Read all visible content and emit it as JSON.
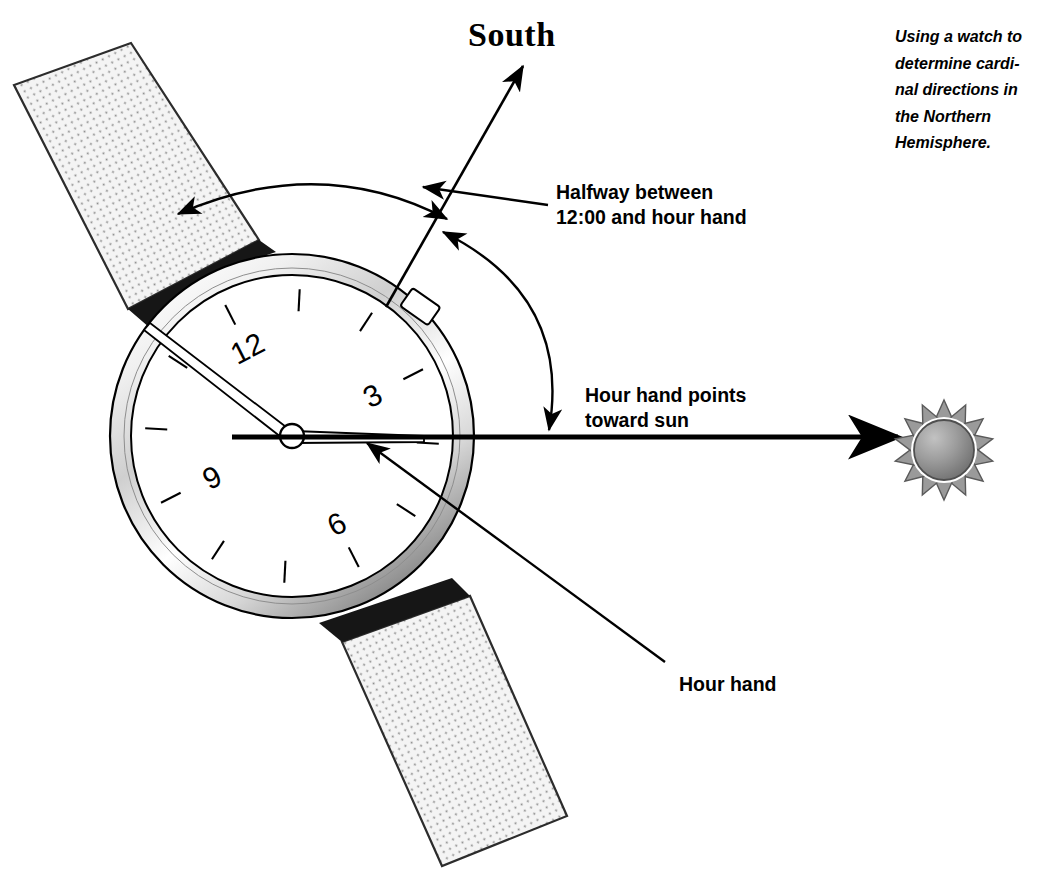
{
  "figure": {
    "caption": "Using a watch to determine cardi-\nnal directions in the Northern\nHemisphere.",
    "background_color": "#ffffff",
    "ink_color": "#000000"
  },
  "labels": {
    "south": "South",
    "halfway": "Halfway between\n12:00 and hour hand",
    "hour_points_toward_sun": "Hour hand points\ntoward sun",
    "hour_hand": "Hour hand"
  },
  "watch": {
    "rotation_degrees": -27,
    "center": {
      "x": 292,
      "y": 436
    },
    "dial_radius": 160,
    "case_outer_radius": 182,
    "case_inner_radius": 163,
    "numerals": [
      {
        "label": "12",
        "hour": 12
      },
      {
        "label": "3",
        "hour": 3
      },
      {
        "label": "6",
        "hour": 6
      },
      {
        "label": "9",
        "hour": 9
      }
    ],
    "tick_count": 12,
    "hands": {
      "hour": {
        "points_to_hours": 3.0,
        "label": "hour-hand"
      },
      "minute": {
        "points_to_minutes": 52,
        "label": "minute-hand"
      }
    },
    "crown": {
      "at_hour": 2.2
    },
    "band": {
      "fill_color": "#f2f2f2",
      "dot_color": "#808080",
      "shadow_color": "#1a1a1a"
    },
    "case_colors": {
      "highlight": "#ffffff",
      "midtone": "#c9c9c9",
      "shadow": "#6e6e6e",
      "outline": "#000000"
    },
    "dial_color": "#ffffff"
  },
  "sun": {
    "center": {
      "x": 944,
      "y": 450
    },
    "disc_radius": 31,
    "ray_count": 14,
    "disc_color_light": "#b4b4b4",
    "disc_color_dark": "#6d6d6d",
    "ray_color": "#9a9a9a",
    "outline_color": "#4a4a4a"
  },
  "arrows": {
    "south_arrow": {
      "from": {
        "x": 390,
        "y": 300
      },
      "to": {
        "x": 524,
        "y": 65
      },
      "name": "south-direction-arrow"
    },
    "sun_arrow": {
      "from": {
        "x": 455,
        "y": 437
      },
      "to": {
        "x": 900,
        "y": 437
      },
      "name": "hour-hand-to-sun-arrow",
      "thickness": 5
    },
    "arc_twelve_to_south": {
      "name": "arc-12-to-south",
      "double_headed": true
    },
    "arc_south_to_hour": {
      "name": "arc-south-to-hour-hand",
      "double_headed": true
    },
    "leader_halfway": {
      "from": {
        "x": 548,
        "y": 204
      },
      "to": {
        "x": 424,
        "y": 186
      },
      "name": "halfway-label-leader"
    },
    "leader_hour_hand": {
      "from": {
        "x": 664,
        "y": 662
      },
      "to": {
        "x": 368,
        "y": 443
      },
      "name": "hour-hand-label-leader"
    }
  }
}
